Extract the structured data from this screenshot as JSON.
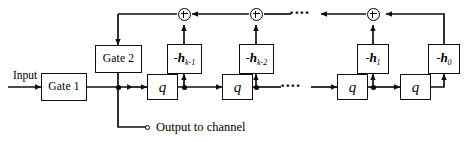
{
  "diagram": {
    "stroke_color": "#0f0f0f",
    "background": "#ffffff",
    "labels": {
      "input": "Input",
      "output": "Output to channel"
    },
    "gates": [
      {
        "id": "gate1",
        "label": "Gate 1"
      },
      {
        "id": "gate2",
        "label": "Gate 2"
      }
    ],
    "delays": [
      {
        "id": "q1",
        "label": "q"
      },
      {
        "id": "q2",
        "label": "q"
      },
      {
        "id": "q3",
        "label": "q"
      },
      {
        "id": "q4",
        "label": "q"
      }
    ],
    "taps": [
      {
        "id": "h-k-1",
        "sign": "-",
        "symbol": "h",
        "subscript": "k-1",
        "text": "-h_{k-1}"
      },
      {
        "id": "h-k-2",
        "sign": "-",
        "symbol": "h",
        "subscript": "k-2",
        "text": "-h_{k-2}"
      },
      {
        "id": "h-1",
        "sign": "-",
        "symbol": "h",
        "subscript": "1",
        "text": "-h_1"
      },
      {
        "id": "h-0",
        "sign": "-",
        "symbol": "h",
        "subscript": "0",
        "text": "-h_0"
      }
    ],
    "adders": [
      {
        "id": "sum-1",
        "glyph": "+"
      },
      {
        "id": "sum-2",
        "glyph": "+"
      },
      {
        "id": "sum-3",
        "glyph": "+"
      }
    ],
    "ellipses": [
      {
        "id": "top-ellipsis",
        "glyph": "••••"
      },
      {
        "id": "mid-ellipsis",
        "glyph": "••••"
      }
    ]
  }
}
